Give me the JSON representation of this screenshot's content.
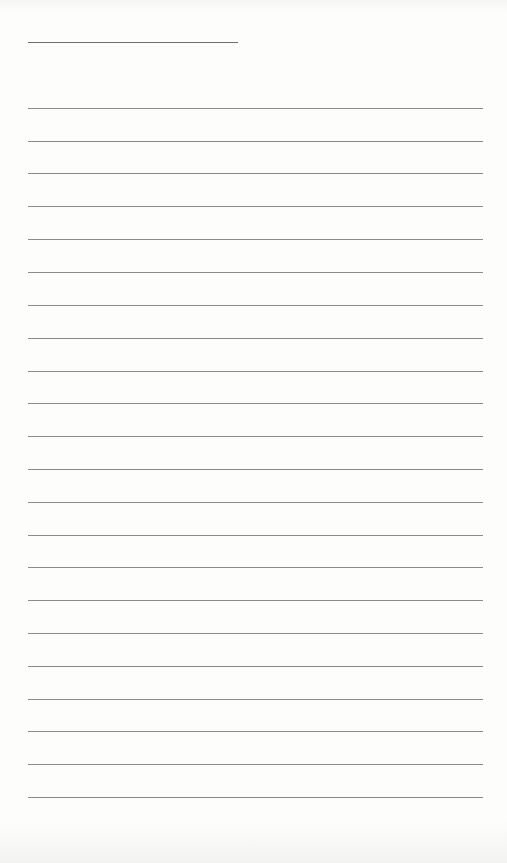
{
  "page": {
    "type": "blank lined sheet",
    "header_line": {
      "label": "",
      "value": ""
    },
    "lines": [
      {
        "y": 108,
        "text": ""
      },
      {
        "y": 141,
        "text": ""
      },
      {
        "y": 173,
        "text": ""
      },
      {
        "y": 206,
        "text": ""
      },
      {
        "y": 239,
        "text": ""
      },
      {
        "y": 272,
        "text": ""
      },
      {
        "y": 305,
        "text": ""
      },
      {
        "y": 338,
        "text": ""
      },
      {
        "y": 371,
        "text": ""
      },
      {
        "y": 403,
        "text": ""
      },
      {
        "y": 436,
        "text": ""
      },
      {
        "y": 469,
        "text": ""
      },
      {
        "y": 502,
        "text": ""
      },
      {
        "y": 535,
        "text": ""
      },
      {
        "y": 567,
        "text": ""
      },
      {
        "y": 600,
        "text": ""
      },
      {
        "y": 633,
        "text": ""
      },
      {
        "y": 666,
        "text": ""
      },
      {
        "y": 699,
        "text": ""
      },
      {
        "y": 731,
        "text": ""
      },
      {
        "y": 764,
        "text": ""
      },
      {
        "y": 797,
        "text": ""
      }
    ],
    "colors": {
      "paper": "#fdfdfc",
      "rule": "#8a8a8a",
      "header_rule": "#6e6e6e"
    }
  }
}
